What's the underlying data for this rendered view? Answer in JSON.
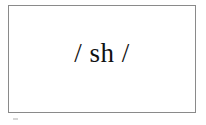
{
  "page": {
    "width": 206,
    "height": 125,
    "background_color": "#ffffff"
  },
  "frame": {
    "border_color": "#8a8a8a",
    "fill_color": "#ffffff",
    "border_width_px": 1
  },
  "content": {
    "phoneme": "/ sh /",
    "text_color": "#111111",
    "font_size_px": 27
  },
  "artifact": {
    "color": "#cfcfcf"
  }
}
